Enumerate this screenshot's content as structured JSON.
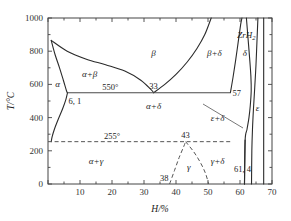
{
  "figure": {
    "background_color": "#ffffff",
    "line_color": "#2b2b2b"
  },
  "axes": {
    "x": {
      "label": "H/%",
      "min": 0,
      "max": 70,
      "ticks": [
        0,
        10,
        20,
        30,
        40,
        50,
        60,
        70
      ],
      "tick_labels": [
        "",
        "10",
        "20",
        "30",
        "40",
        "50",
        "60",
        "70"
      ],
      "minor_step": 5
    },
    "y": {
      "label": "T/°C",
      "min": 0,
      "max": 1000,
      "ticks": [
        0,
        200,
        400,
        600,
        800,
        1000
      ],
      "tick_labels": [
        "0",
        "200",
        "400",
        "600",
        "800",
        "1000"
      ],
      "minor_step": 100
    }
  },
  "chart_data": {
    "type": "line",
    "xlabel": "H/%",
    "ylabel": "T/°C",
    "xlim": [
      0,
      70
    ],
    "ylim": [
      0,
      1000
    ],
    "grid": false,
    "legend": "none",
    "invariant_lines": [
      {
        "name": "eutectoid-550",
        "temperature": 550,
        "label": "550°",
        "x_from": 6.1,
        "x_to": 57,
        "style": "solid"
      },
      {
        "name": "transition-255",
        "temperature": 255,
        "label": "255°",
        "x_from": 0,
        "x_to": 57,
        "style": "dashed"
      }
    ],
    "invariant_points": [
      {
        "label": "6, 1",
        "x": 6.1,
        "y": 550
      },
      {
        "label": "33",
        "x": 33,
        "y": 550
      },
      {
        "label": "57",
        "x": 57,
        "y": 550
      },
      {
        "label": "43",
        "x": 43,
        "y": 255
      },
      {
        "label": "38",
        "x": 38,
        "y": 0
      },
      {
        "label": "61, 4",
        "x": 61.4,
        "y": 0
      }
    ],
    "boundaries": [
      {
        "name": "alpha-solvus-left",
        "style": "solid",
        "points": [
          [
            1.0,
            865
          ],
          [
            2.2,
            780
          ],
          [
            3.6,
            700
          ],
          [
            4.8,
            625
          ],
          [
            5.8,
            560
          ],
          [
            6.1,
            550
          ]
        ]
      },
      {
        "name": "alpha-solvus-lower",
        "style": "solid",
        "points": [
          [
            6.1,
            550
          ],
          [
            5.6,
            510
          ],
          [
            4.6,
            455
          ],
          [
            3.2,
            390
          ],
          [
            2.0,
            330
          ],
          [
            1.3,
            285
          ],
          [
            1.0,
            255
          ]
        ]
      },
      {
        "name": "beta-liquidus-upper",
        "style": "solid",
        "points": [
          [
            1.0,
            865
          ],
          [
            6.0,
            800
          ],
          [
            12.0,
            752
          ],
          [
            18.0,
            718
          ],
          [
            24.0,
            680
          ],
          [
            29.0,
            625
          ],
          [
            32.2,
            568
          ],
          [
            33.0,
            550
          ]
        ]
      },
      {
        "name": "beta-delta-right",
        "style": "solid",
        "points": [
          [
            33.0,
            550
          ],
          [
            36.5,
            600
          ],
          [
            40.0,
            660
          ],
          [
            43.5,
            735
          ],
          [
            46.5,
            815
          ],
          [
            49.0,
            900
          ],
          [
            51.0,
            1000
          ]
        ]
      },
      {
        "name": "delta-left-upper",
        "style": "solid",
        "points": [
          [
            57.0,
            550
          ],
          [
            57.8,
            640
          ],
          [
            58.6,
            740
          ],
          [
            59.4,
            850
          ],
          [
            60.2,
            960
          ],
          [
            60.6,
            1000
          ]
        ]
      },
      {
        "name": "delta-right",
        "style": "solid",
        "points": [
          [
            62.0,
            1000
          ],
          [
            62.5,
            880
          ],
          [
            63.0,
            760
          ],
          [
            63.4,
            650
          ],
          [
            63.5,
            560
          ],
          [
            63.2,
            470
          ],
          [
            62.8,
            400
          ],
          [
            62.2,
            330
          ],
          [
            61.6,
            265
          ],
          [
            61.4,
            0
          ]
        ]
      },
      {
        "name": "epsilon-left",
        "style": "solid",
        "points": [
          [
            65.6,
            1000
          ],
          [
            65.3,
            860
          ],
          [
            65.0,
            720
          ],
          [
            64.6,
            580
          ],
          [
            64.2,
            450
          ],
          [
            63.9,
            330
          ],
          [
            63.7,
            200
          ],
          [
            63.6,
            0
          ]
        ]
      },
      {
        "name": "epsilon-right",
        "style": "solid",
        "points": [
          [
            67.4,
            1000
          ],
          [
            67.4,
            600
          ],
          [
            67.4,
            300
          ],
          [
            67.4,
            0
          ]
        ]
      },
      {
        "name": "gamma-left",
        "style": "dashed",
        "points": [
          [
            38.0,
            0
          ],
          [
            39.5,
            80
          ],
          [
            41.0,
            160
          ],
          [
            42.4,
            225
          ],
          [
            43.0,
            255
          ]
        ]
      },
      {
        "name": "gamma-right",
        "style": "dashed",
        "points": [
          [
            43.0,
            255
          ],
          [
            45.5,
            195
          ],
          [
            47.6,
            130
          ],
          [
            49.2,
            65
          ],
          [
            50.2,
            0
          ]
        ]
      },
      {
        "name": "epsilon-delta-tail",
        "style": "solid",
        "points": [
          [
            61.6,
            265
          ],
          [
            61.5,
            130
          ],
          [
            61.4,
            0
          ]
        ]
      }
    ],
    "region_labels": [
      {
        "text": "α",
        "x": 3.0,
        "y": 600
      },
      {
        "text": "α+β",
        "x": 13.0,
        "y": 660
      },
      {
        "text": "β",
        "x": 33.0,
        "y": 790
      },
      {
        "text": "β+δ",
        "x": 52.0,
        "y": 790
      },
      {
        "text": "δ",
        "x": 61.5,
        "y": 790
      },
      {
        "text": "ε",
        "x": 65.5,
        "y": 460
      },
      {
        "text": "α+δ",
        "x": 33.0,
        "y": 470
      },
      {
        "text": "ε+δ",
        "x": 53.0,
        "y": 395
      },
      {
        "text": "α+γ",
        "x": 15.0,
        "y": 140
      },
      {
        "text": "γ",
        "x": 44.0,
        "y": 105
      },
      {
        "text": "γ+δ",
        "x": 53.0,
        "y": 140
      },
      {
        "text": "ZrH2",
        "x": 62.0,
        "y": 895
      }
    ]
  },
  "labels": {
    "alpha": "α",
    "alpha_beta": "α+β",
    "beta": "β",
    "beta_delta": "β+δ",
    "delta": "δ",
    "epsilon": "ε",
    "alpha_delta": "α+δ",
    "epsilon_delta": "ε+δ",
    "alpha_gamma": "α+γ",
    "gamma": "γ",
    "gamma_delta": "γ+δ",
    "zrh2_main": "ZrH",
    "zrh2_sub": "2",
    "temp_550": "550°",
    "temp_255": "255°",
    "pt_61": "6, 1",
    "pt_33": "33",
    "pt_57": "57",
    "pt_43": "43",
    "pt_38": "38",
    "pt_614": "61, 4",
    "y_axis_title": "T/°C",
    "x_axis_title": "H/%"
  }
}
